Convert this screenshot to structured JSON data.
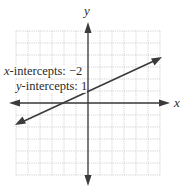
{
  "chart_data": {
    "type": "line",
    "title": "",
    "xlabel": "x",
    "ylabel": "y",
    "xlim": [
      -6,
      6
    ],
    "ylim": [
      -6,
      6
    ],
    "grid": true,
    "series": [
      {
        "name": "line",
        "equation": "y = 0.5x + 1",
        "x": [
          -6,
          6
        ],
        "y": [
          -2,
          4
        ],
        "arrows": "both"
      }
    ],
    "annotations": [
      {
        "text": "x-intercepts: −2",
        "value": -2
      },
      {
        "text": "y-intercepts: 1",
        "value": 1
      }
    ]
  },
  "labels": {
    "x_axis": "x",
    "y_axis": "y",
    "x_intercept_var": "x",
    "x_intercept_text": "-intercepts: −2",
    "y_intercept_var": "y",
    "y_intercept_text": "-intercepts: 1"
  },
  "colors": {
    "grid": "#c8c8c8",
    "axis": "#3a3a3a",
    "line": "#3a3a3a"
  }
}
